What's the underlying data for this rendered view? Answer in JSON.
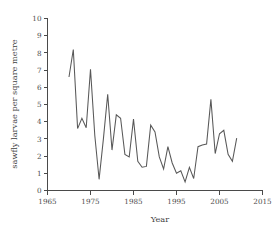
{
  "chart_data": {
    "type": "line",
    "title": "",
    "subtitle": "",
    "xlabel": "Year",
    "ylabel": "sawfly larvae per square metre",
    "xlim": [
      1965,
      2015
    ],
    "ylim": [
      0,
      10
    ],
    "xticks": [
      1965,
      1975,
      1985,
      1995,
      2005,
      2015
    ],
    "yticks": [
      0,
      1,
      2,
      3,
      4,
      5,
      6,
      7,
      8,
      9,
      10
    ],
    "xtick_labels": [
      "1965",
      "1975",
      "1985",
      "1995",
      "2005",
      "2015"
    ],
    "ytick_labels": [
      "0",
      "1",
      "2",
      "3",
      "4",
      "5",
      "6",
      "7",
      "8",
      "9",
      "10"
    ],
    "grid": false,
    "legend": false,
    "legend_position": "none",
    "line_color": "#585858",
    "axis_color": "#4a4a4a",
    "background_color": "#ffffff",
    "series": [
      {
        "name": "sawfly larvae density",
        "x": [
          1970,
          1971,
          1972,
          1973,
          1974,
          1975,
          1976,
          1977,
          1978,
          1979,
          1980,
          1981,
          1982,
          1983,
          1984,
          1985,
          1986,
          1987,
          1988,
          1989,
          1990,
          1991,
          1992,
          1993,
          1994,
          1995,
          1996,
          1997,
          1998,
          1999,
          2000,
          2001,
          2002,
          2003,
          2004,
          2005,
          2006,
          2007,
          2008,
          2009
        ],
        "values": [
          6.6,
          8.2,
          3.6,
          4.2,
          3.65,
          7.05,
          3.2,
          0.65,
          3.0,
          5.6,
          2.35,
          4.4,
          4.2,
          2.1,
          1.95,
          4.15,
          1.7,
          1.35,
          1.4,
          3.8,
          3.4,
          1.95,
          1.25,
          2.55,
          1.6,
          1.0,
          1.15,
          0.5,
          1.35,
          0.7,
          2.55,
          2.65,
          2.7,
          5.3,
          2.15,
          3.3,
          3.5,
          2.1,
          1.7,
          3.05
        ]
      }
    ]
  },
  "axis_labels": {
    "y_axis_title": "sawfly larvae per square metre",
    "x_axis_title": "Year"
  }
}
